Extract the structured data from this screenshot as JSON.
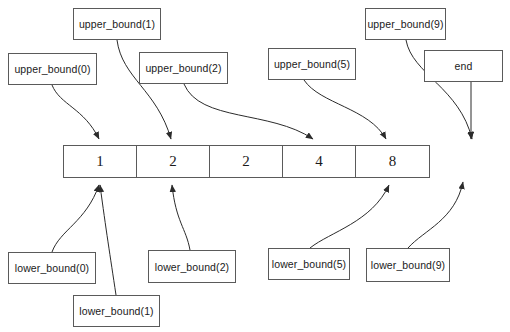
{
  "diagram": {
    "colors": {
      "stroke": "#5a5a5a",
      "edge": "#2b2b2b",
      "text": "#1a1a1a",
      "background": "#ffffff"
    },
    "array": {
      "name": "sorted-array",
      "cells": [
        {
          "value": "1"
        },
        {
          "value": "2"
        },
        {
          "value": "2"
        },
        {
          "value": "4"
        },
        {
          "value": "8"
        }
      ]
    },
    "upper_nodes": [
      {
        "id": "upper-bound-0",
        "label": "upper_bound(0)",
        "x": 8,
        "y": 53,
        "w": 89,
        "h": 32
      },
      {
        "id": "upper-bound-1",
        "label": "upper_bound(1)",
        "x": 73,
        "y": 8,
        "w": 88,
        "h": 32
      },
      {
        "id": "upper-bound-2",
        "label": "upper_bound(2)",
        "x": 139,
        "y": 52,
        "w": 89,
        "h": 32
      },
      {
        "id": "upper-bound-5",
        "label": "upper_bound(5)",
        "x": 268,
        "y": 48,
        "w": 88,
        "h": 32
      },
      {
        "id": "upper-bound-9",
        "label": "upper_bound(9)",
        "x": 365,
        "y": 8,
        "w": 81,
        "h": 32
      },
      {
        "id": "end",
        "label": "end",
        "x": 424,
        "y": 50,
        "w": 79,
        "h": 32
      }
    ],
    "lower_nodes": [
      {
        "id": "lower-bound-0",
        "label": "lower_bound(0)",
        "x": 8,
        "y": 252,
        "w": 88,
        "h": 32
      },
      {
        "id": "lower-bound-1",
        "label": "lower_bound(1)",
        "x": 73,
        "y": 295,
        "w": 87,
        "h": 32
      },
      {
        "id": "lower-bound-2",
        "label": "lower_bound(2)",
        "x": 148,
        "y": 250,
        "w": 88,
        "h": 33
      },
      {
        "id": "lower-bound-5",
        "label": "lower_bound(5)",
        "x": 268,
        "y": 248,
        "w": 82,
        "h": 32
      },
      {
        "id": "lower-bound-9",
        "label": "lower_bound(9)",
        "x": 366,
        "y": 248,
        "w": 84,
        "h": 34
      }
    ]
  }
}
